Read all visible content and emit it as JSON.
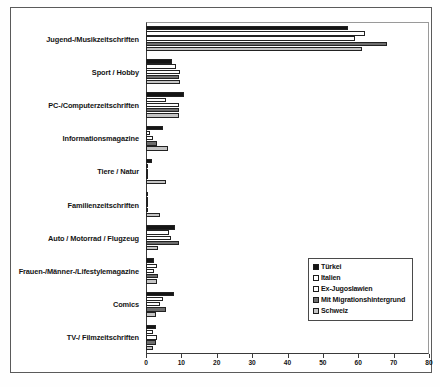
{
  "chart_data": {
    "type": "bar",
    "orientation": "horizontal",
    "title": "",
    "subtitle": "",
    "xlabel": "",
    "ylabel": "",
    "xlim": [
      0,
      80
    ],
    "xticks": [
      0,
      10,
      20,
      30,
      40,
      50,
      60,
      70,
      80
    ],
    "grid": false,
    "legend_position": "inside-right",
    "categories": [
      "Jugend-/Musikzeitschriften",
      "Sport / Hobby",
      "PC-/Computerzeitschriften",
      "Informationsmagazine",
      "Tiere / Natur",
      "Familienzeitschriften",
      "Auto / Motorrad / Flugzeug",
      "Frauen-/Männer-/Lifestylemagazine",
      "Comics",
      "TV-/ Filmzeitschriften"
    ],
    "series": [
      {
        "name": "Türkei",
        "color": "#151515",
        "values": [
          57.0,
          7.4,
          10.7,
          4.8,
          1.6,
          0.6,
          8.2,
          2.2,
          7.9,
          2.8
        ]
      },
      {
        "name": "Italien",
        "color": "#ffffff",
        "values": [
          62.0,
          8.4,
          5.6,
          1.0,
          0.5,
          0.4,
          6.5,
          3.1,
          4.9,
          2.0
        ]
      },
      {
        "name": "Ex-Jugoslawien",
        "color": "#fdfdfd",
        "values": [
          59.0,
          9.6,
          9.3,
          2.0,
          0.6,
          0.3,
          7.1,
          2.4,
          4.0,
          3.0
        ]
      },
      {
        "name": "Mit Migrationshintergrund",
        "color": "#6e6e6e",
        "values": [
          68.0,
          9.3,
          9.3,
          3.1,
          0.7,
          0.5,
          9.3,
          3.4,
          5.6,
          2.9
        ]
      },
      {
        "name": "Schweiz",
        "color": "#c4c4c4",
        "values": [
          61.0,
          9.6,
          9.3,
          6.2,
          5.6,
          4.0,
          3.4,
          3.2,
          2.9,
          2.1
        ]
      }
    ]
  },
  "legend": {
    "entries": [
      {
        "label": "Türkei"
      },
      {
        "label": "Italien"
      },
      {
        "label": "Ex-Jugoslawien"
      },
      {
        "label": "Mit Migrationshintergrund"
      },
      {
        "label": "Schweiz"
      }
    ]
  }
}
